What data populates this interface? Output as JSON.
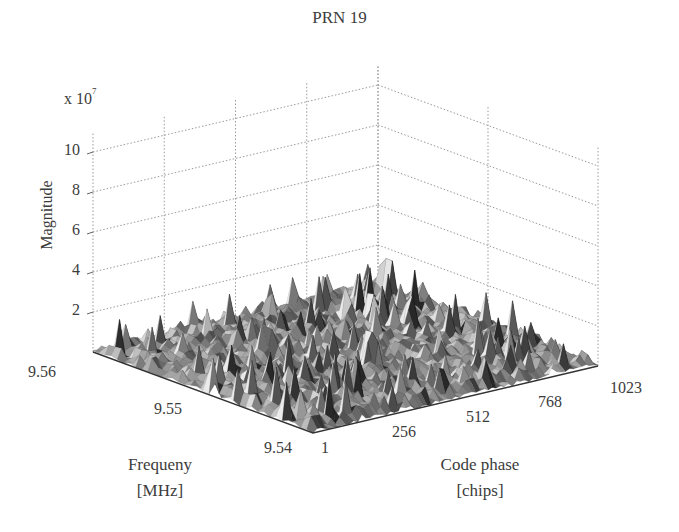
{
  "chart_data": {
    "type": "surface3d",
    "title": "PRN 19",
    "zlabel": "Magnitude",
    "z_scale_label": "x 10",
    "z_scale_exponent": "7",
    "z_ticks": [
      "2",
      "4",
      "6",
      "8",
      "10"
    ],
    "zlim": [
      0,
      11
    ],
    "xlabel_line1": "Code phase",
    "xlabel_line2": "[chips]",
    "x_ticks": [
      "1",
      "256",
      "512",
      "768",
      "1023"
    ],
    "xlim": [
      1,
      1023
    ],
    "ylabel_line1": "Frequency",
    "ylabel_line2": "[MHz]",
    "y_ticks": [
      "9.54",
      "9.55",
      "9.56"
    ],
    "ylim": [
      9.54,
      9.56
    ],
    "grid": true,
    "colormap": "gray"
  },
  "labels": {
    "title": "PRN 19",
    "scale_base": "x 10",
    "scale_exp": "7",
    "magnitude": "Magnitude",
    "freq1": "Frequeny",
    "freq2": "[MHz]",
    "code1": "Code phase",
    "code2": "[chips]"
  }
}
